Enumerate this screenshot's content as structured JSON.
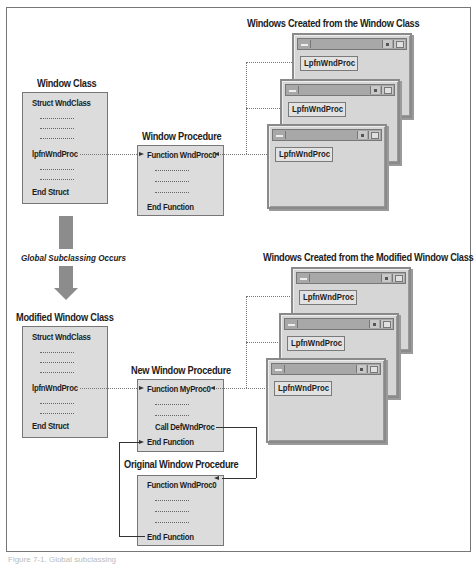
{
  "top": {
    "window_class": {
      "title": "Window Class",
      "lines": [
        "Struct WndClass",
        "...............",
        "...............",
        "...............",
        "lpfnWndProc",
        "...............",
        "...............",
        "End Struct"
      ]
    },
    "window_procedure": {
      "title": "Window Procedure",
      "lines": [
        "Function WndProc0",
        "...............",
        "...............",
        "...............",
        "End Function"
      ]
    },
    "windows_group": {
      "title": "Windows Created from the Window Class",
      "windows": [
        {
          "field": "LpfnWndProc"
        },
        {
          "field": "LpfnWndProc"
        },
        {
          "field": "LpfnWndProc"
        }
      ]
    }
  },
  "transition": {
    "label": "Global Subclassing Occurs"
  },
  "bottom": {
    "modified_window_class": {
      "title": "Modified Window Class",
      "lines": [
        "Struct WndClass",
        "...............",
        "...............",
        "...............",
        "lpfnWndProc",
        "...............",
        "...............",
        "End Struct"
      ]
    },
    "new_window_procedure": {
      "title": "New Window Procedure",
      "lines": [
        "Function MyProc0",
        "...............",
        "...............",
        "Call DefWndProc",
        "End Function"
      ]
    },
    "original_window_procedure": {
      "title": "Original Window Procedure",
      "lines": [
        "Function WndProc0",
        "...............",
        "...............",
        "...............",
        "End Function"
      ]
    },
    "windows_group": {
      "title": "Windows Created from the Modified Window Class",
      "windows": [
        {
          "field": "LpfnWndProc"
        },
        {
          "field": "LpfnWndProc"
        },
        {
          "field": "LpfnWndProc"
        }
      ]
    }
  },
  "caption": "Figure 7-1. Global subclassing"
}
